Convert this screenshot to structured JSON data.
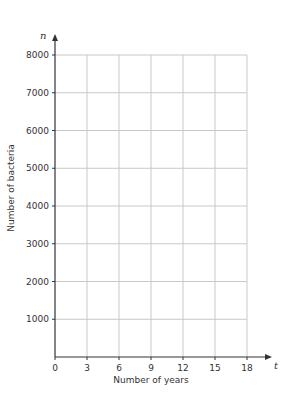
{
  "chart_data": {
    "type": "line",
    "title": "",
    "xlabel": "Number of years",
    "ylabel": "Number of bacteria",
    "x_var": "t",
    "y_var": "n",
    "xlim": [
      0,
      18
    ],
    "ylim": [
      0,
      8000
    ],
    "x_ticks": [
      0,
      3,
      6,
      9,
      12,
      15,
      18
    ],
    "y_ticks": [
      1000,
      2000,
      3000,
      4000,
      5000,
      6000,
      7000,
      8000
    ],
    "x_tick_labels": [
      "0",
      "3",
      "6",
      "9",
      "12",
      "15",
      "18"
    ],
    "y_tick_labels": [
      "1000",
      "2000",
      "3000",
      "4000",
      "5000",
      "6000",
      "7000",
      "8000"
    ],
    "grid": true,
    "series": [],
    "legend": null
  },
  "colors": {
    "axis": "#333333",
    "grid": "#c8c8c8",
    "text": "#333333",
    "background": "#ffffff"
  }
}
